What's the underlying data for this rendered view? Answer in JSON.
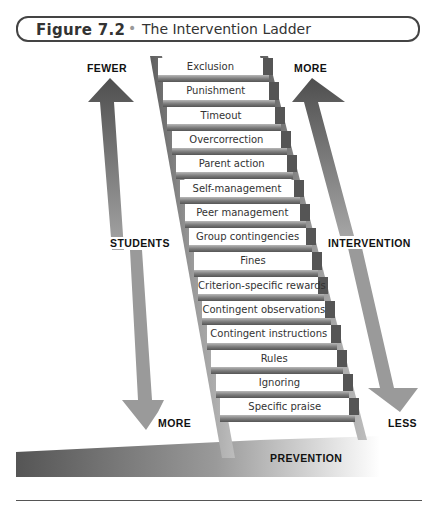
{
  "figure": {
    "number": "Figure 7.2",
    "separator": "•",
    "title": "The Intervention Ladder"
  },
  "ladder": {
    "rungs": [
      "Exclusion",
      "Punishment",
      "Timeout",
      "Overcorrection",
      "Parent action",
      "Self-management",
      "Peer management",
      "Group contingencies",
      "Fines",
      "Criterion-specific rewards",
      "Contingent observations",
      "Contingent instructions",
      "Rules",
      "Ignoring",
      "Specific praise"
    ]
  },
  "left_arrow": {
    "top_label": "FEWER",
    "middle_label": "STUDENTS",
    "bottom_label": "MORE"
  },
  "right_arrow": {
    "top_label": "MORE",
    "middle_label": "INTERVENTION",
    "bottom_label": "LESS"
  },
  "base": {
    "label": "PREVENTION"
  },
  "colors": {
    "arrow_dark": "#555555",
    "arrow_light": "#9a9a9a",
    "rail": "#7a7a7a",
    "rung": "#8c8c8c",
    "text": "#111111"
  }
}
